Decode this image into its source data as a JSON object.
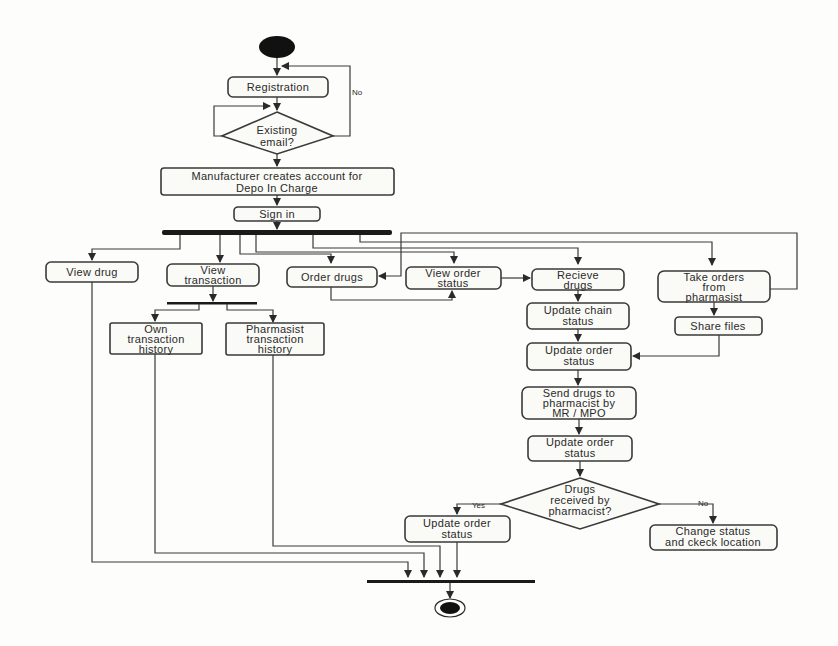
{
  "diagram": {
    "type": "uml-activity",
    "nodes": {
      "registration": [
        "Registration"
      ],
      "existing_email": [
        "Existing",
        "email?"
      ],
      "manufacturer_creates": [
        "Manufacturer creates account for",
        "Depo In Charge"
      ],
      "sign_in": [
        "Sign in"
      ],
      "view_drug": [
        "View drug"
      ],
      "view_transaction": [
        "View",
        "transaction"
      ],
      "own_history": [
        "Own",
        "transaction",
        "history"
      ],
      "pharmasist_history": [
        "Pharmasist",
        "transaction",
        "history"
      ],
      "order_drugs": [
        "Order drugs"
      ],
      "view_order_status": [
        "View order",
        "status"
      ],
      "recieve_drugs": [
        "Recieve",
        "drugs"
      ],
      "take_orders": [
        "Take orders",
        "from",
        "pharmasist"
      ],
      "share_files": [
        "Share files"
      ],
      "update_chain_status": [
        "Update chain",
        "status"
      ],
      "update_order_status_1": [
        "Update order",
        "status"
      ],
      "send_drugs": [
        "Send drugs to",
        "pharmacist by",
        "MR / MPO"
      ],
      "update_order_status_2": [
        "Update order",
        "status"
      ],
      "drugs_received": [
        "Drugs",
        "received by",
        "pharmacist?"
      ],
      "update_order_status_3": [
        "Update order",
        "status"
      ],
      "change_status": [
        "Change status",
        "and ckeck location"
      ]
    },
    "edge_labels": {
      "no_registration": "No",
      "yes": "Yes",
      "no": "No"
    }
  }
}
